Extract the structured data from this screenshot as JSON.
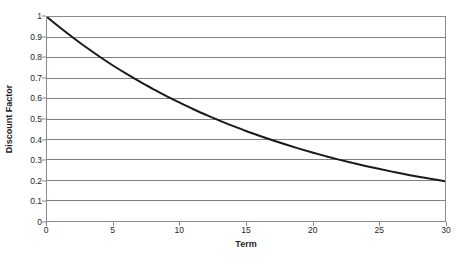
{
  "chart_data": {
    "type": "line",
    "title": "",
    "xlabel": "Term",
    "ylabel": "Discount Factor",
    "xlim": [
      0,
      30
    ],
    "ylim": [
      0,
      1
    ],
    "grid": true,
    "grid_axis": "y",
    "legend": false,
    "legend_position": "none",
    "xticks": [
      0,
      5,
      10,
      15,
      20,
      25,
      30
    ],
    "xtick_labels": [
      "0",
      "5",
      "10",
      "15",
      "20",
      "25",
      "30"
    ],
    "yticks": [
      0,
      0.1,
      0.2,
      0.3,
      0.4,
      0.5,
      0.6,
      0.7,
      0.8,
      0.9,
      1
    ],
    "ytick_labels": [
      "0",
      "0.1",
      "0.2",
      "0.3",
      "0.4",
      "0.5",
      "0.6",
      "0.7",
      "0.8",
      "0.9",
      "1"
    ],
    "series": [
      {
        "name": "Discount Factor",
        "color": "#1a1a1a",
        "line_width": 2,
        "x": [
          0,
          1,
          2,
          3,
          4,
          5,
          6,
          7,
          8,
          9,
          10,
          11,
          12,
          13,
          14,
          15,
          16,
          17,
          18,
          19,
          20,
          21,
          22,
          23,
          24,
          25,
          26,
          27,
          28,
          29,
          30
        ],
        "values": [
          1.0,
          0.947,
          0.897,
          0.849,
          0.804,
          0.761,
          0.721,
          0.683,
          0.647,
          0.612,
          0.58,
          0.549,
          0.52,
          0.492,
          0.466,
          0.441,
          0.418,
          0.396,
          0.375,
          0.355,
          0.336,
          0.318,
          0.301,
          0.285,
          0.27,
          0.256,
          0.242,
          0.229,
          0.217,
          0.206,
          0.195
        ]
      }
    ],
    "colors": {
      "line": "#1a1a1a",
      "gridline": "#808080",
      "axis": "#8a8a8a",
      "plot_background": "#ffffff",
      "text": "#231f20"
    }
  }
}
